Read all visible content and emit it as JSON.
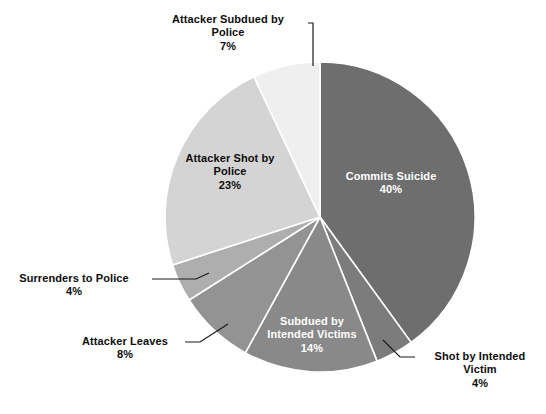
{
  "chart_data": {
    "type": "pie",
    "title": "",
    "subtitle": "",
    "xlabel": "",
    "ylabel": "",
    "legend_position": "none",
    "grid": false,
    "value_unit": "percent",
    "total": 100,
    "start_angle_deg": 0,
    "direction": "clockwise",
    "categories": [
      "Commits Suicide",
      "Shot by Intended Victim",
      "Subdued by Intended Victims",
      "Attacker Leaves",
      "Surrenders to Police",
      "Attacker Shot by Police",
      "Attacker Subdued by Police"
    ],
    "values": [
      40,
      4,
      14,
      8,
      4,
      23,
      7
    ],
    "colors": [
      "#6e6e6e",
      "#7c7c7c",
      "#898989",
      "#939393",
      "#aeaeae",
      "#d4d4d4",
      "#efefef"
    ],
    "slices": [
      {
        "name": "Commits Suicide",
        "value": 40,
        "value_label": "40%",
        "color": "#6e6e6e",
        "label_placement": "inside",
        "text_color": "light",
        "lines": [
          "Commits Suicide"
        ]
      },
      {
        "name": "Shot by Intended Victim",
        "value": 4,
        "value_label": "4%",
        "color": "#7c7c7c",
        "label_placement": "outside",
        "text_color": "dark",
        "lines": [
          "Shot by Intended",
          "Victim"
        ]
      },
      {
        "name": "Subdued by Intended Victims",
        "value": 14,
        "value_label": "14%",
        "color": "#898989",
        "label_placement": "inside",
        "text_color": "light",
        "lines": [
          "Subdued by",
          "Intended Victims"
        ]
      },
      {
        "name": "Attacker Leaves",
        "value": 8,
        "value_label": "8%",
        "color": "#939393",
        "label_placement": "outside",
        "text_color": "dark",
        "lines": [
          "Attacker Leaves"
        ]
      },
      {
        "name": "Surrenders to Police",
        "value": 4,
        "value_label": "4%",
        "color": "#aeaeae",
        "label_placement": "outside",
        "text_color": "dark",
        "lines": [
          "Surrenders to Police"
        ]
      },
      {
        "name": "Attacker Shot by Police",
        "value": 23,
        "value_label": "23%",
        "color": "#d4d4d4",
        "label_placement": "inside",
        "text_color": "dark",
        "lines": [
          "Attacker Shot by",
          "Police"
        ]
      },
      {
        "name": "Attacker Subdued by Police",
        "value": 7,
        "value_label": "7%",
        "color": "#efefef",
        "label_placement": "outside",
        "text_color": "dark",
        "lines": [
          "Attacker Subdued by",
          "Police"
        ]
      }
    ]
  },
  "labels": {
    "commits_suicide": {
      "line1": "Commits Suicide",
      "pct": "40%"
    },
    "shot_by_intended_victim": {
      "line1": "Shot by Intended",
      "line2": "Victim",
      "pct": "4%"
    },
    "subdued_by_intended_victims": {
      "line1": "Subdued by",
      "line2": "Intended Victims",
      "pct": "14%"
    },
    "attacker_leaves": {
      "line1": "Attacker Leaves",
      "pct": "8%"
    },
    "surrenders_to_police": {
      "line1": "Surrenders to Police",
      "pct": "4%"
    },
    "attacker_shot_by_police": {
      "line1": "Attacker Shot by",
      "line2": "Police",
      "pct": "23%"
    },
    "attacker_subdued_by_police": {
      "line1": "Attacker Subdued by",
      "line2": "Police",
      "pct": "7%"
    }
  },
  "palette": {
    "background": "#ffffff",
    "slice_border": "#ffffff",
    "leader_line": "#1a1a1a",
    "text_dark": "#0d0d0d",
    "text_light": "#ffffff"
  }
}
